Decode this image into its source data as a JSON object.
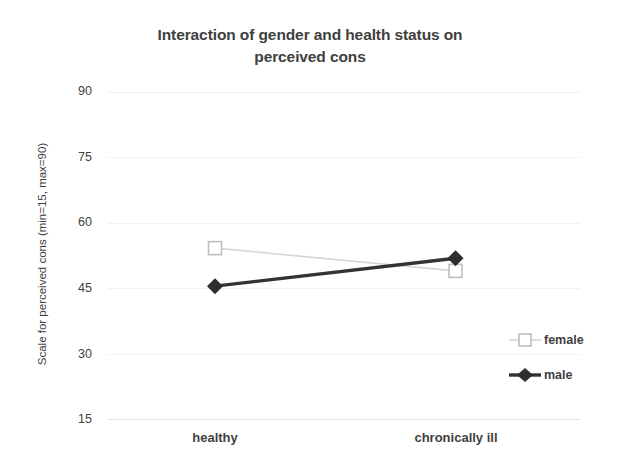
{
  "chart_data": {
    "type": "line",
    "title": "Interaction of gender and health status on perceived cons",
    "title_line1": "Interaction of gender and health status on",
    "title_line2": "perceived cons",
    "xlabel": "",
    "ylabel": "Scale for perceived cons  (min=15, max=90)",
    "categories": [
      "healthy",
      "chronically ill"
    ],
    "yticks": [
      "90",
      "75",
      "60",
      "45",
      "30",
      "15"
    ],
    "ytick_values": [
      90,
      75,
      60,
      45,
      30,
      15
    ],
    "ylim": [
      15,
      90
    ],
    "grid": true,
    "legend_position": "right",
    "series": [
      {
        "name": "female",
        "values": [
          54.3,
          49.1
        ],
        "color": "#d6d6d6",
        "marker": "open-square"
      },
      {
        "name": "male",
        "values": [
          45.6,
          52.0
        ],
        "color": "#333333",
        "marker": "filled-diamond"
      }
    ]
  },
  "legend": {
    "items": [
      {
        "label": "female"
      },
      {
        "label": "male"
      }
    ]
  },
  "colors": {
    "female_line": "#d6d6d6",
    "male_line": "#333333",
    "text": "#3f3f3f",
    "title": "#404040",
    "gridline": "#f1f1f1",
    "background": "#ffffff"
  }
}
